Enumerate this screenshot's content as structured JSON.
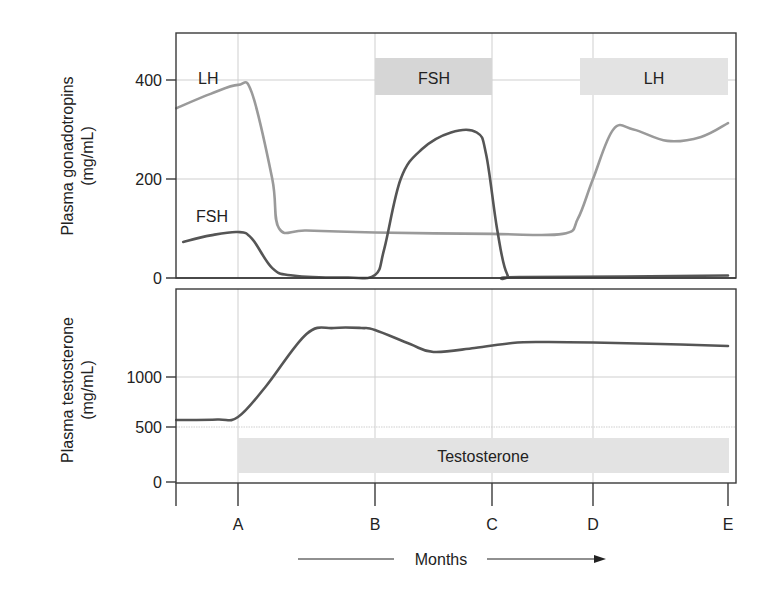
{
  "colors": {
    "background": "#ffffff",
    "frame": "#3a3a3a",
    "grid": "#cfcfcf",
    "lh_line": "#9a9a9a",
    "fsh_line": "#555555",
    "testosterone_line": "#555555",
    "band_fill": "#e3e3e3",
    "band_fill_dark": "#d6d6d6",
    "text": "#222222"
  },
  "chart_data": [
    {
      "type": "line",
      "panel": "top",
      "title": "",
      "ylabel": "Plasma gonadotropins (mg/mL)",
      "ylabel_lines": [
        "Plasma gonadotropins",
        "(mg/mL)"
      ],
      "xlabel": "Months",
      "x_categories": [
        "A",
        "B",
        "C",
        "D",
        "E"
      ],
      "ylim": [
        0,
        500
      ],
      "yticks": [
        0,
        200,
        400
      ],
      "grid": true,
      "series": [
        {
          "name": "LH",
          "label": "LH",
          "points": [
            {
              "x": -0.45,
              "y": 343
            },
            {
              "x": -0.2,
              "y": 372
            },
            {
              "x": 0.0,
              "y": 390
            },
            {
              "x": 0.1,
              "y": 375
            },
            {
              "x": 0.25,
              "y": 200
            },
            {
              "x": 0.3,
              "y": 100
            },
            {
              "x": 0.5,
              "y": 96
            },
            {
              "x": 1.0,
              "y": 92
            },
            {
              "x": 2.0,
              "y": 89
            },
            {
              "x": 2.7,
              "y": 89
            },
            {
              "x": 2.85,
              "y": 120
            },
            {
              "x": 3.0,
              "y": 200
            },
            {
              "x": 3.15,
              "y": 300
            },
            {
              "x": 3.3,
              "y": 300
            },
            {
              "x": 3.55,
              "y": 277
            },
            {
              "x": 3.8,
              "y": 285
            },
            {
              "x": 4.0,
              "y": 313
            }
          ]
        },
        {
          "name": "FSH",
          "label": "FSH",
          "points": [
            {
              "x": -0.4,
              "y": 73
            },
            {
              "x": -0.2,
              "y": 86
            },
            {
              "x": 0.0,
              "y": 93
            },
            {
              "x": 0.1,
              "y": 80
            },
            {
              "x": 0.25,
              "y": 20
            },
            {
              "x": 0.4,
              "y": 5
            },
            {
              "x": 0.8,
              "y": 1
            },
            {
              "x": 1.0,
              "y": 6
            },
            {
              "x": 1.08,
              "y": 60
            },
            {
              "x": 1.22,
              "y": 200
            },
            {
              "x": 1.4,
              "y": 260
            },
            {
              "x": 1.65,
              "y": 294
            },
            {
              "x": 1.87,
              "y": 294
            },
            {
              "x": 1.95,
              "y": 250
            },
            {
              "x": 2.05,
              "y": 100
            },
            {
              "x": 2.15,
              "y": 8
            },
            {
              "x": 2.3,
              "y": 2
            },
            {
              "x": 4.0,
              "y": 5
            }
          ]
        }
      ],
      "bands": [
        {
          "label": "FSH",
          "x_start": 1.0,
          "x_end": 2.0,
          "y_top": 445,
          "y_bottom": 370
        },
        {
          "label": "LH",
          "x_start": 2.9,
          "x_end": 4.0,
          "y_top": 445,
          "y_bottom": 370
        }
      ],
      "annotations": [
        {
          "text": "LH",
          "x": -0.2,
          "y": 415
        },
        {
          "text": "FSH",
          "x": -0.2,
          "y": 130
        }
      ]
    },
    {
      "type": "line",
      "panel": "bottom",
      "title": "",
      "ylabel": "Plasma testosterone (mg/mL)",
      "ylabel_lines": [
        "Plasma testosterone",
        "(mg/mL)"
      ],
      "xlabel": "Months",
      "x_categories": [
        "A",
        "B",
        "C",
        "D",
        "E"
      ],
      "ylim": [
        0,
        1900
      ],
      "yticks": [
        0,
        500,
        1000
      ],
      "grid": true,
      "series": [
        {
          "name": "Testosterone",
          "points": [
            {
              "x": -0.45,
              "y": 570
            },
            {
              "x": -0.15,
              "y": 575
            },
            {
              "x": 0.0,
              "y": 600
            },
            {
              "x": 0.2,
              "y": 900
            },
            {
              "x": 0.5,
              "y": 1430
            },
            {
              "x": 0.7,
              "y": 1490
            },
            {
              "x": 0.9,
              "y": 1490
            },
            {
              "x": 1.0,
              "y": 1470
            },
            {
              "x": 1.3,
              "y": 1330
            },
            {
              "x": 1.5,
              "y": 1250
            },
            {
              "x": 1.85,
              "y": 1290
            },
            {
              "x": 2.2,
              "y": 1340
            },
            {
              "x": 2.5,
              "y": 1350
            },
            {
              "x": 3.0,
              "y": 1345
            },
            {
              "x": 3.5,
              "y": 1330
            },
            {
              "x": 4.0,
              "y": 1310
            }
          ]
        }
      ],
      "bands": [
        {
          "label": "Testosterone",
          "x_start": 0.0,
          "x_end": 4.0,
          "y_top": 400,
          "y_bottom": 80
        }
      ]
    }
  ],
  "axis": {
    "x_label": "Months",
    "x_ticks": [
      "A",
      "B",
      "C",
      "D",
      "E"
    ],
    "top_y_ticks": [
      "0",
      "200",
      "400"
    ],
    "bottom_y_ticks": [
      "0",
      "500",
      "1000"
    ]
  },
  "labels": {
    "top_ylabel_line1": "Plasma gonadotropins",
    "top_ylabel_line2": "(mg/mL)",
    "bottom_ylabel_line1": "Plasma testosterone",
    "bottom_ylabel_line2": "(mg/mL)",
    "lh_curve_label": "LH",
    "fsh_curve_label": "FSH",
    "fsh_band_label": "FSH",
    "lh_band_label": "LH",
    "testosterone_band_label": "Testosterone",
    "months_label": "Months"
  }
}
